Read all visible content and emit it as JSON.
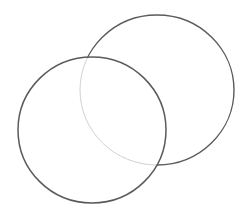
{
  "drawing": {
    "description": "Two overlapping pencil-sketched circles",
    "background": "#ffffff",
    "stroke_color": "#5a5a5a",
    "hidden_line_color": "#d0d0d0",
    "circles": [
      {
        "name": "back-circle",
        "cx": 157,
        "cy": 90,
        "rx": 77,
        "ry": 75
      },
      {
        "name": "front-circle",
        "cx": 92,
        "cy": 130,
        "rx": 74,
        "ry": 73
      }
    ]
  }
}
